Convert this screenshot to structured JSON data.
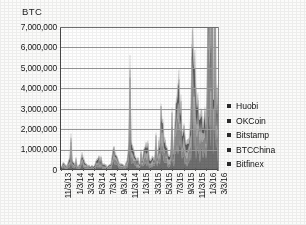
{
  "chart_data": {
    "type": "area",
    "stacked": true,
    "title": "",
    "ylabel": "BTC",
    "xlabel": "",
    "ylim": [
      0,
      7000000
    ],
    "grid": true,
    "legend_position": "right",
    "ytick_labels": [
      "7,000,000",
      "6,000,000",
      "5,000,000",
      "4,000,000",
      "3,000,000",
      "2,000,000",
      "1,000,000",
      "0"
    ],
    "ytick_values": [
      7000000,
      6000000,
      5000000,
      4000000,
      3000000,
      2000000,
      1000000,
      0
    ],
    "xtick_labels": [
      "11/3/13",
      "1/3/14",
      "3/3/14",
      "5/3/14",
      "7/3/14",
      "9/3/14",
      "11/3/14",
      "1/3/15",
      "3/3/15",
      "5/3/15",
      "7/3/15",
      "9/3/15",
      "11/3/15",
      "1/3/16",
      "3/3/16"
    ],
    "series": [
      {
        "name": "Huobi",
        "color": "#6f6f6f",
        "values": [
          40000,
          120000,
          95000,
          70000,
          60000,
          55000,
          130000,
          210000,
          160000,
          120000,
          90000,
          75000,
          60000,
          55000,
          70000,
          140000,
          260000,
          180000,
          120000,
          95000,
          80000,
          70000,
          65000,
          60000,
          55000,
          60000,
          80000,
          150000,
          230000,
          190000,
          140000,
          110000,
          95000,
          80000,
          70000,
          65000,
          60000,
          70000,
          110000,
          200000,
          340000,
          260000,
          180000,
          140000,
          120000,
          100000,
          90000,
          85000,
          80000,
          90000,
          140000,
          300000,
          520000,
          430000,
          320000,
          240000,
          190000,
          160000,
          140000,
          125000,
          115000,
          120000,
          160000,
          280000,
          460000,
          380000,
          290000,
          230000,
          190000,
          170000,
          160000,
          155000,
          150000,
          170000,
          260000,
          520000,
          900000,
          760000,
          560000,
          420000,
          340000,
          290000,
          260000,
          240000,
          230000,
          260000,
          420000,
          900000,
          1500000,
          1250000,
          940000,
          720000,
          580000,
          500000,
          450000,
          420000,
          400000,
          440000,
          700000,
          1400000,
          2250000,
          1850000,
          1400000,
          1080000,
          880000,
          760000,
          680000,
          640000,
          610000,
          660000,
          980000,
          1850000,
          2850000,
          2350000,
          1780000,
          1380000,
          1120000,
          970000,
          880000,
          820000
        ]
      },
      {
        "name": "OKCoin",
        "color": "#8a8a8a",
        "values": [
          35000,
          100000,
          85000,
          62000,
          52000,
          48000,
          110000,
          180000,
          140000,
          105000,
          80000,
          66000,
          52000,
          48000,
          62000,
          120000,
          220000,
          155000,
          105000,
          84000,
          70000,
          62000,
          58000,
          52000,
          48000,
          52000,
          70000,
          130000,
          200000,
          165000,
          122000,
          96000,
          84000,
          70000,
          62000,
          58000,
          52000,
          62000,
          96000,
          175000,
          295000,
          225000,
          156000,
          122000,
          105000,
          88000,
          78000,
          74000,
          70000,
          78000,
          122000,
          260000,
          450000,
          372000,
          278000,
          208000,
          165000,
          140000,
          122000,
          108000,
          100000,
          105000,
          140000,
          243000,
          400000,
          330000,
          250000,
          200000,
          165000,
          148000,
          140000,
          135000,
          130000,
          148000,
          225000,
          450000,
          780000,
          660000,
          486000,
          364000,
          295000,
          252000,
          225000,
          208000,
          200000,
          225000,
          364000,
          780000,
          1300000,
          1085000,
          815000,
          625000,
          503000,
          434000,
          390000,
          364000,
          347000,
          382000,
          607000,
          1215000,
          1950000,
          1605000,
          1215000,
          937000,
          763000,
          659000,
          590000,
          555000,
          529000,
          572000,
          850000,
          1605000,
          2470000,
          2040000,
          1545000,
          1197000,
          971000,
          841000,
          763000,
          711000
        ]
      },
      {
        "name": "Bitstamp",
        "color": "#a5a5a5",
        "values": [
          22000,
          64000,
          52000,
          40000,
          33000,
          30000,
          70000,
          115000,
          88000,
          66000,
          50000,
          42000,
          33000,
          30000,
          40000,
          76000,
          140000,
          99000,
          66000,
          53000,
          44000,
          40000,
          36000,
          33000,
          30000,
          33000,
          44000,
          83000,
          127000,
          105000,
          77000,
          61000,
          53000,
          44000,
          40000,
          36000,
          33000,
          40000,
          61000,
          110000,
          187000,
          143000,
          99000,
          77000,
          66000,
          55000,
          50000,
          47000,
          44000,
          50000,
          77000,
          165000,
          286000,
          237000,
          176000,
          132000,
          105000,
          88000,
          77000,
          69000,
          64000,
          66000,
          88000,
          154000,
          253000,
          209000,
          159000,
          127000,
          105000,
          94000,
          88000,
          86000,
          83000,
          94000,
          143000,
          286000,
          495000,
          418000,
          308000,
          231000,
          187000,
          160000,
          143000,
          132000,
          127000,
          143000,
          231000,
          495000,
          825000,
          688000,
          517000,
          396000,
          319000,
          275000,
          248000,
          231000,
          220000,
          242000,
          385000,
          770000,
          1237000,
          1018000,
          770000,
          594000,
          484000,
          418000,
          374000,
          352000,
          335000,
          363000,
          539000,
          1018000,
          1567000,
          1294000,
          980000,
          759000,
          616000,
          533000,
          484000,
          451000
        ]
      },
      {
        "name": "BTCChina",
        "color": "#5a5a5a",
        "values": [
          30000,
          86000,
          70000,
          52000,
          44000,
          40000,
          94000,
          154000,
          118000,
          88000,
          66000,
          55000,
          44000,
          40000,
          52000,
          101000,
          187000,
          132000,
          88000,
          70000,
          59000,
          52000,
          48000,
          44000,
          40000,
          44000,
          59000,
          110000,
          169000,
          140000,
          103000,
          81000,
          70000,
          59000,
          52000,
          48000,
          44000,
          52000,
          81000,
          147000,
          249000,
          191000,
          132000,
          103000,
          88000,
          74000,
          66000,
          62000,
          59000,
          66000,
          103000,
          220000,
          381000,
          316000,
          235000,
          176000,
          140000,
          118000,
          103000,
          92000,
          85000,
          88000,
          118000,
          205000,
          337000,
          279000,
          212000,
          169000,
          140000,
          125000,
          118000,
          114000,
          110000,
          125000,
          191000,
          381000,
          660000,
          558000,
          411000,
          308000,
          249000,
          213000,
          191000,
          176000,
          169000,
          191000,
          308000,
          660000,
          1100000,
          917000,
          690000,
          528000,
          425000,
          367000,
          330000,
          308000,
          294000,
          323000,
          513000,
          1026000,
          1650000,
          1357000,
          1026000,
          792000,
          645000,
          557000,
          499000,
          469000,
          447000,
          484000,
          719000,
          1357000,
          2090000,
          1726000,
          1307000,
          1012000,
          821000,
          711000,
          645000,
          601000
        ]
      },
      {
        "name": "Bitfinex",
        "color": "#bdbdbd",
        "values": [
          14000,
          40000,
          33000,
          25000,
          21000,
          19000,
          44000,
          72000,
          55000,
          41000,
          31000,
          26000,
          21000,
          19000,
          25000,
          48000,
          88000,
          62000,
          41000,
          33000,
          28000,
          25000,
          23000,
          21000,
          19000,
          21000,
          28000,
          52000,
          79000,
          66000,
          48000,
          38000,
          33000,
          28000,
          25000,
          23000,
          21000,
          25000,
          38000,
          69000,
          117000,
          89000,
          62000,
          48000,
          41000,
          34000,
          31000,
          29000,
          28000,
          31000,
          48000,
          103000,
          179000,
          148000,
          110000,
          83000,
          66000,
          55000,
          48000,
          43000,
          40000,
          41000,
          55000,
          96000,
          158000,
          131000,
          99000,
          79000,
          66000,
          59000,
          55000,
          54000,
          52000,
          59000,
          89000,
          179000,
          310000,
          261000,
          193000,
          145000,
          117000,
          100000,
          89000,
          83000,
          79000,
          89000,
          145000,
          310000,
          516000,
          430000,
          323000,
          248000,
          199000,
          172000,
          155000,
          145000,
          138000,
          151000,
          241000,
          482000,
          774000,
          636000,
          482000,
          371000,
          302000,
          261000,
          234000,
          220000,
          210000,
          227000,
          337000,
          636000,
          980000,
          809000,
          613000,
          474000,
          385000,
          333000,
          302000,
          282000
        ]
      }
    ]
  },
  "legend": {
    "items": [
      {
        "label": "Huobi"
      },
      {
        "label": "OKCoin"
      },
      {
        "label": "Bitstamp"
      },
      {
        "label": "BTCChina"
      },
      {
        "label": "Bitfinex"
      }
    ]
  }
}
